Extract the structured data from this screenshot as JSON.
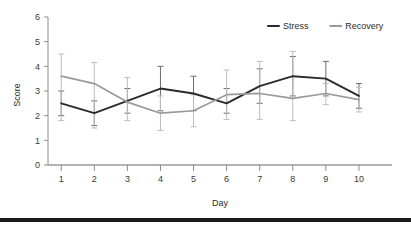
{
  "chart_data": {
    "type": "line",
    "title": "",
    "subtitle": "",
    "xlabel": "Day",
    "ylabel": "Score",
    "categories": [
      "1",
      "2",
      "3",
      "4",
      "5",
      "6",
      "7",
      "8",
      "9",
      "10"
    ],
    "x": [
      1,
      2,
      3,
      4,
      5,
      6,
      7,
      8,
      9,
      10
    ],
    "xlim": [
      0.6,
      11.0
    ],
    "ylim": [
      0,
      6
    ],
    "yticks": [
      0,
      1,
      2,
      3,
      4,
      5,
      6
    ],
    "xticks": [
      1,
      2,
      3,
      4,
      5,
      6,
      7,
      8,
      9,
      10
    ],
    "grid": false,
    "legend_position": "top-right",
    "errorbars": true,
    "series": [
      {
        "name": "Stress",
        "color": "#2b2b2b",
        "values": [
          2.5,
          2.1,
          2.6,
          3.1,
          2.9,
          2.5,
          3.2,
          3.6,
          3.5,
          2.8
        ],
        "err_low": [
          2.0,
          1.6,
          2.1,
          2.2,
          2.2,
          2.1,
          2.5,
          2.8,
          2.8,
          2.3
        ],
        "err_high": [
          3.0,
          2.6,
          3.1,
          4.0,
          3.6,
          3.1,
          3.9,
          4.4,
          4.2,
          3.3
        ]
      },
      {
        "name": "Recovery",
        "color": "#9a9a9a",
        "values": [
          3.6,
          3.3,
          2.55,
          2.1,
          2.2,
          2.85,
          2.9,
          2.7,
          2.9,
          2.65
        ],
        "err_low": [
          1.8,
          1.5,
          1.8,
          1.4,
          1.55,
          1.85,
          1.85,
          1.8,
          2.45,
          2.15
        ],
        "err_high": [
          4.5,
          4.15,
          3.55,
          2.8,
          2.85,
          3.85,
          4.2,
          4.6,
          3.3,
          3.15
        ]
      }
    ]
  },
  "axes": {
    "y_tick_labels": [
      "0",
      "1",
      "2",
      "3",
      "4",
      "5",
      "6"
    ],
    "x_tick_labels": [
      "1",
      "2",
      "3",
      "4",
      "5",
      "6",
      "7",
      "8",
      "9",
      "10"
    ],
    "y_axis_title": "Score",
    "x_axis_title": "Day"
  },
  "legend": {
    "items": [
      {
        "label": "Stress",
        "color": "#2b2b2b"
      },
      {
        "label": "Recovery",
        "color": "#9a9a9a"
      }
    ]
  },
  "colors": {
    "stress": "#2b2b2b",
    "recovery": "#9a9a9a",
    "axis": "#8c8c8c",
    "text": "#2b2b2b",
    "background": "#ffffff",
    "bottom_bar": "#1a1a1a"
  }
}
